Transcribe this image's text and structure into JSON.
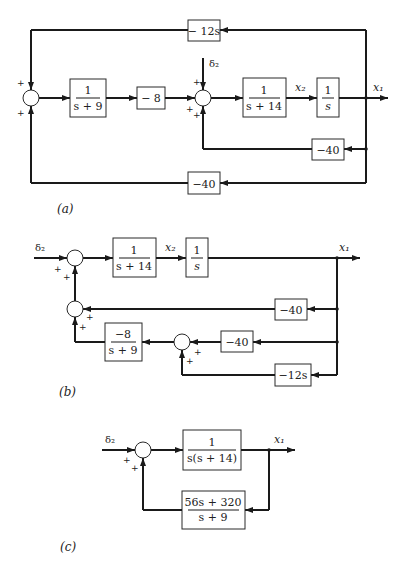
{
  "figure": {
    "panels": [
      {
        "id": "a",
        "caption": "(a)",
        "blocks": {
          "g_s9": {
            "num": "1",
            "den": "s + 9"
          },
          "g_m8": {
            "label": "− 8"
          },
          "g_s14": {
            "num": "1",
            "den": "s + 14"
          },
          "g_int": {
            "num": "1",
            "den": "s"
          },
          "fb_top": {
            "label": "− 12s"
          },
          "fb_mid": {
            "label": "−40"
          },
          "fb_bot": {
            "label": "−40"
          }
        },
        "signals": {
          "input": "δ₂",
          "x2": "x₂",
          "x1": "x₁"
        },
        "signs": {
          "plus": "+"
        }
      },
      {
        "id": "b",
        "caption": "(b)",
        "blocks": {
          "g_s14": {
            "num": "1",
            "den": "s + 14"
          },
          "g_int": {
            "num": "1",
            "den": "s"
          },
          "fb_40a": {
            "label": "−40"
          },
          "fb_40b": {
            "label": "−40"
          },
          "fb_12s": {
            "label": "−12s"
          },
          "g_m8": {
            "num": "−8",
            "den": "s + 9"
          }
        },
        "signals": {
          "input": "δ₂",
          "x2": "x₂",
          "x1": "x₁"
        },
        "signs": {
          "plus": "+"
        }
      },
      {
        "id": "c",
        "caption": "(c)",
        "blocks": {
          "forward": {
            "num": "1",
            "den": "s(s + 14)"
          },
          "feedback": {
            "num": "56s + 320",
            "den": "s + 9"
          }
        },
        "signals": {
          "input": "δ₂",
          "x1": "x₁"
        },
        "signs": {
          "plus": "+"
        }
      }
    ]
  }
}
